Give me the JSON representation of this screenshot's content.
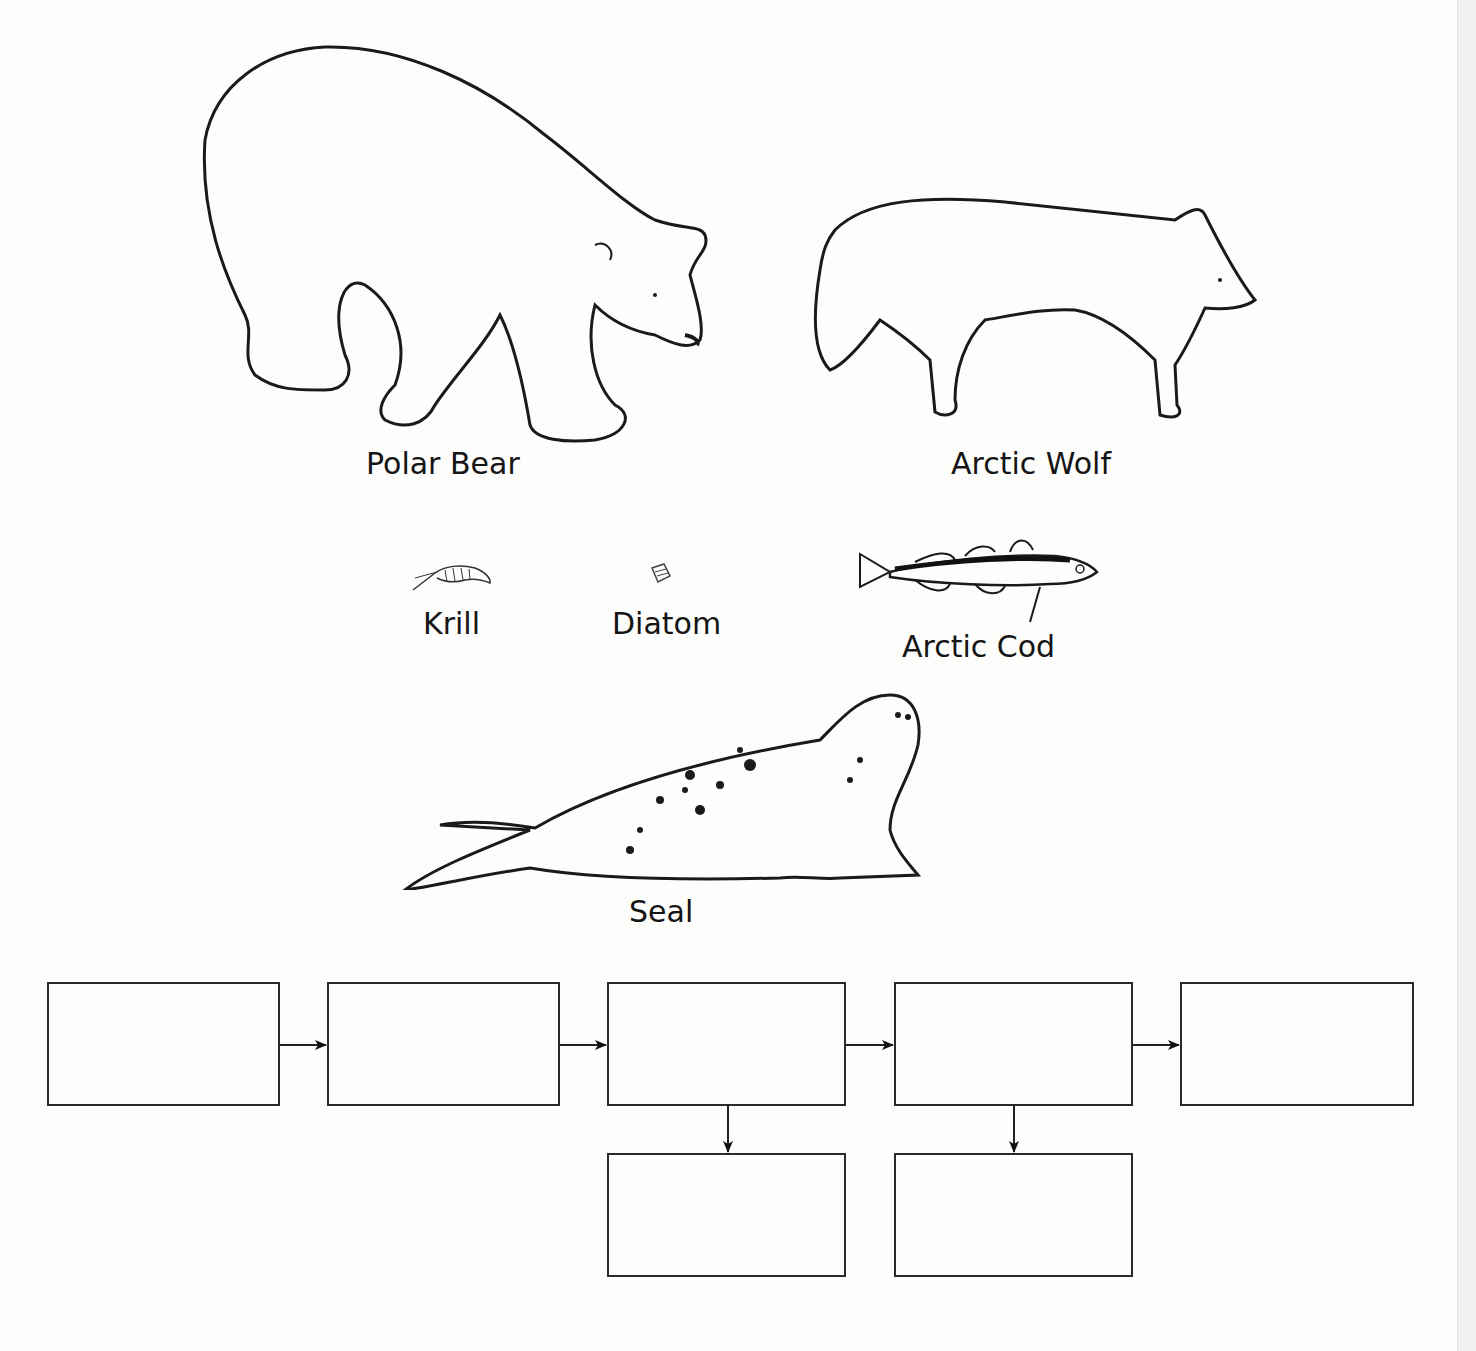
{
  "organisms": [
    {
      "id": "polar-bear",
      "label": "Polar Bear"
    },
    {
      "id": "arctic-wolf",
      "label": "Arctic Wolf"
    },
    {
      "id": "krill",
      "label": "Krill"
    },
    {
      "id": "diatom",
      "label": "Diatom"
    },
    {
      "id": "arctic-cod",
      "label": "Arctic Cod"
    },
    {
      "id": "seal",
      "label": "Seal"
    }
  ],
  "food_chain_boxes": {
    "row1": [
      "",
      "",
      "",
      "",
      ""
    ],
    "row2": [
      "",
      ""
    ]
  },
  "colors": {
    "line": "#2a2a2a",
    "background": "#fdfdfc"
  }
}
